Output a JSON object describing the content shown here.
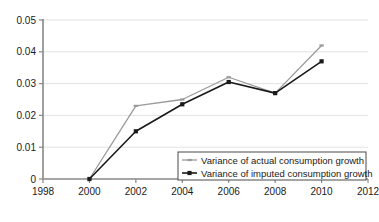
{
  "chart_data": {
    "type": "line",
    "title": "",
    "subtitle": "",
    "xlabel": "",
    "ylabel": "",
    "x": [
      2000,
      2002,
      2004,
      2006,
      2008,
      2010
    ],
    "xlim": [
      1998,
      2012
    ],
    "ylim": [
      0,
      0.05
    ],
    "xticks": [
      "1998",
      "2000",
      "2002",
      "2004",
      "2006",
      "2008",
      "2010",
      "2012"
    ],
    "xtick_values": [
      1998,
      2000,
      2002,
      2004,
      2006,
      2008,
      2010,
      2012
    ],
    "yticks": [
      "0",
      "0.01",
      "0.02",
      "0.03",
      "0.04",
      "0.05"
    ],
    "ytick_values": [
      0,
      0.01,
      0.02,
      0.03,
      0.04,
      0.05
    ],
    "grid": true,
    "grid_axis": "y",
    "legend_position": "bottom-right",
    "series": [
      {
        "name": "Variance of actual consumption growth",
        "color": "#9a9a9a",
        "marker": "dash",
        "values": [
          0,
          0.023,
          0.025,
          0.032,
          0.027,
          0.042
        ]
      },
      {
        "name": "Variance of imputed consumption growth",
        "color": "#1a1a1a",
        "marker": "square",
        "values": [
          0,
          0.015,
          0.0235,
          0.0305,
          0.027,
          0.037
        ]
      }
    ]
  },
  "axes": {
    "y_axis_label": "",
    "x_axis_label": ""
  },
  "legend": {
    "entries": [
      {
        "label": "Variance of actual consumption growth"
      },
      {
        "label": "Variance of imputed consumption growth"
      }
    ]
  },
  "colors": {
    "actual": "#9a9a9a",
    "imputed": "#1a1a1a",
    "grid": "#e2e2e2",
    "axis": "#888888",
    "legend_border": "#4a4a4a",
    "background": "#ffffff"
  }
}
